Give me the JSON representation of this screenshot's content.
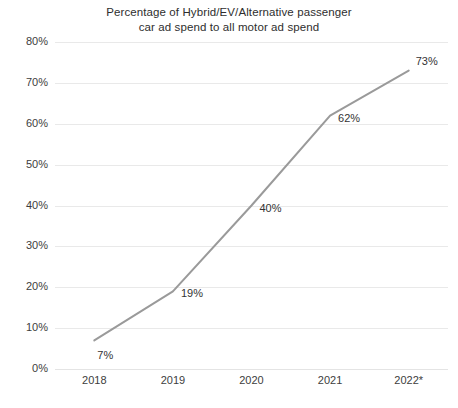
{
  "chart_data": {
    "type": "line",
    "title": "Percentage of Hybrid/EV/Alternative passenger\ncar ad spend to all motor ad spend",
    "xlabel": "",
    "ylabel": "",
    "categories": [
      "2018",
      "2019",
      "2020",
      "2021",
      "2022*"
    ],
    "values": [
      7,
      19,
      40,
      62,
      73
    ],
    "point_labels": [
      "7%",
      "19%",
      "40%",
      "62%",
      "73%"
    ],
    "ylim": [
      0,
      80
    ],
    "ytick_values": [
      0,
      10,
      20,
      30,
      40,
      50,
      60,
      70,
      80
    ],
    "ytick_labels": [
      "0%",
      "10%",
      "20%",
      "30%",
      "40%",
      "50%",
      "60%",
      "70%",
      "80%"
    ],
    "grid": true,
    "legend": false,
    "line_color": "#9a9a9a",
    "grid_color": "#e9e9e9",
    "text_color": "#3a3a3a",
    "background_color": "#ffffff",
    "unit": "%",
    "note": "2022* denotes estimated value"
  }
}
